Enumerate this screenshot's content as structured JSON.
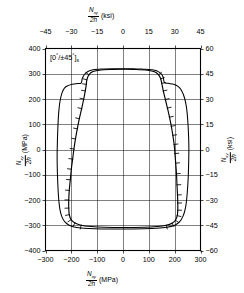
{
  "annotation": {
    "text": "[0°/±45°]s",
    "laminate": "[0/±45]s"
  },
  "chart_data": {
    "type": "line",
    "title": "",
    "subtitle": "",
    "annotation": "[0°/±45°]s",
    "xlabel_bottom": "Nxy/2h (MPa)",
    "xlabel_top": "Nxy/2h (ksi)",
    "ylabel_left": "Nxy/2h (MPa)",
    "ylabel_right": "Nxy/2h (ksi)",
    "x_unit_primary": "MPa",
    "x_unit_secondary": "ksi",
    "y_unit_primary": "MPa",
    "y_unit_secondary": "ksi",
    "xlim_mpa": [
      -300,
      300
    ],
    "ylim_mpa": [
      -400,
      400
    ],
    "xlim_ksi": [
      -45,
      45
    ],
    "ylim_ksi": [
      -60,
      60
    ],
    "xticks_bottom": [
      -300,
      -200,
      -100,
      0,
      100,
      200,
      300
    ],
    "xticklabels_bottom": [
      "-300",
      "-200",
      "-100",
      "0",
      "100",
      "200",
      "300"
    ],
    "xticks_top": [
      -45,
      -30,
      -15,
      0,
      15,
      30,
      45
    ],
    "xticklabels_top": [
      "-45",
      "-30",
      "-15",
      "0",
      "15",
      "30",
      "45"
    ],
    "yticks_left": [
      400,
      300,
      200,
      100,
      0,
      -100,
      -200,
      -300,
      -400
    ],
    "yticklabels_left": [
      "400",
      "300",
      "200",
      "100",
      "0",
      "-100",
      "-200",
      "-300",
      "-400"
    ],
    "yticks_right": [
      60,
      45,
      30,
      15,
      0,
      -15,
      -30,
      -45,
      -60
    ],
    "yticklabels_right": [
      "60",
      "45",
      "30",
      "15",
      "0",
      "-15",
      "-30",
      "-45",
      "-60"
    ],
    "grid": true,
    "legend": "none",
    "series": [
      {
        "name": "outer-envelope",
        "style": "solid",
        "closed": true,
        "points_mpa": [
          [
            0,
            320
          ],
          [
            40,
            320
          ],
          [
            80,
            318
          ],
          [
            110,
            316
          ],
          [
            130,
            312
          ],
          [
            148,
            300
          ],
          [
            156,
            285
          ],
          [
            160,
            266
          ],
          [
            175,
            262
          ],
          [
            196,
            258
          ],
          [
            213,
            250
          ],
          [
            226,
            235
          ],
          [
            238,
            205
          ],
          [
            246,
            165
          ],
          [
            251,
            110
          ],
          [
            254,
            50
          ],
          [
            255,
            0
          ],
          [
            254,
            -60
          ],
          [
            252,
            -120
          ],
          [
            248,
            -180
          ],
          [
            242,
            -230
          ],
          [
            232,
            -265
          ],
          [
            218,
            -288
          ],
          [
            200,
            -300
          ],
          [
            170,
            -308
          ],
          [
            130,
            -312
          ],
          [
            80,
            -314
          ],
          [
            0,
            -315
          ],
          [
            -60,
            -315
          ],
          [
            -110,
            -314
          ],
          [
            -150,
            -312
          ],
          [
            -185,
            -308
          ],
          [
            -208,
            -300
          ],
          [
            -224,
            -288
          ],
          [
            -236,
            -268
          ],
          [
            -244,
            -238
          ],
          [
            -249,
            -195
          ],
          [
            -252,
            -145
          ],
          [
            -254,
            -90
          ],
          [
            -255,
            -30
          ],
          [
            -254,
            30
          ],
          [
            -252,
            90
          ],
          [
            -249,
            145
          ],
          [
            -244,
            190
          ],
          [
            -236,
            224
          ],
          [
            -226,
            244
          ],
          [
            -212,
            253
          ],
          [
            -196,
            258
          ],
          [
            -178,
            261
          ],
          [
            -162,
            263
          ],
          [
            -158,
            280
          ],
          [
            -150,
            296
          ],
          [
            -136,
            309
          ],
          [
            -116,
            316
          ],
          [
            -80,
            319
          ],
          [
            -40,
            320
          ],
          [
            0,
            320
          ]
        ]
      },
      {
        "name": "inner-hatched-envelope",
        "style": "solid-with-outward-hatching",
        "closed": true,
        "hatch_side": "outward",
        "points_mpa": [
          [
            0,
            318
          ],
          [
            50,
            317
          ],
          [
            95,
            314
          ],
          [
            122,
            308
          ],
          [
            138,
            296
          ],
          [
            146,
            280
          ],
          [
            150,
            262
          ],
          [
            156,
            232
          ],
          [
            164,
            198
          ],
          [
            172,
            164
          ],
          [
            180,
            128
          ],
          [
            187,
            92
          ],
          [
            193,
            56
          ],
          [
            198,
            20
          ],
          [
            201,
            -16
          ],
          [
            204,
            -54
          ],
          [
            207,
            -96
          ],
          [
            209,
            -140
          ],
          [
            211,
            -180
          ],
          [
            212,
            -212
          ],
          [
            212,
            -240
          ],
          [
            210,
            -262
          ],
          [
            203,
            -280
          ],
          [
            190,
            -292
          ],
          [
            168,
            -300
          ],
          [
            132,
            -305
          ],
          [
            80,
            -308
          ],
          [
            0,
            -309
          ],
          [
            -70,
            -308
          ],
          [
            -124,
            -305
          ],
          [
            -162,
            -300
          ],
          [
            -186,
            -291
          ],
          [
            -201,
            -278
          ],
          [
            -208,
            -258
          ],
          [
            -210,
            -232
          ],
          [
            -210,
            -200
          ],
          [
            -208,
            -162
          ],
          [
            -204,
            -120
          ],
          [
            -200,
            -78
          ],
          [
            -195,
            -38
          ],
          [
            -190,
            2
          ],
          [
            -184,
            42
          ],
          [
            -177,
            82
          ],
          [
            -169,
            122
          ],
          [
            -160,
            162
          ],
          [
            -152,
            200
          ],
          [
            -146,
            232
          ],
          [
            -142,
            258
          ],
          [
            -140,
            276
          ],
          [
            -132,
            296
          ],
          [
            -116,
            309
          ],
          [
            -85,
            315
          ],
          [
            -45,
            317
          ],
          [
            0,
            318
          ]
        ]
      }
    ]
  }
}
